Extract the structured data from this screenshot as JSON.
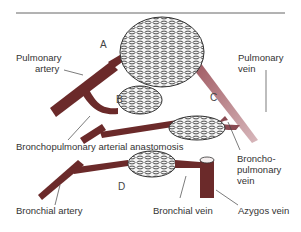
{
  "figure": {
    "topRuleColor": "#555555",
    "arteryColor": "#6b2a2a",
    "veinColor": "#8a4a52",
    "labels": {
      "pulmonary_artery_1": "Pulmonary",
      "pulmonary_artery_2": "artery",
      "pulmonary_vein_1": "Pulmonary",
      "pulmonary_vein_2": "vein",
      "anastomosis": "Bronchopulmonary arterial anastomosis",
      "bronchopulmonary_vein_1": "Broncho-",
      "bronchopulmonary_vein_2": "pulmonary",
      "bronchopulmonary_vein_3": "vein",
      "bronchial_artery": "Bronchial artery",
      "bronchial_vein": "Bronchial vein",
      "azygos_vein": "Azygos vein"
    },
    "letters": {
      "a": "A",
      "b": "B",
      "c": "C",
      "d": "D"
    }
  }
}
